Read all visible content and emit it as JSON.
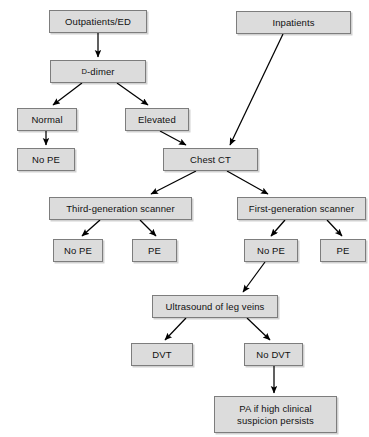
{
  "diagram": {
    "node_fill": "#dcdcdc",
    "node_border": "#7d7d7d",
    "edge_color": "#000000",
    "background": "#ffffff"
  },
  "nodes": {
    "outpatients_ed": "Outpatients/ED",
    "inpatients": "Inpatients",
    "d_dimer_prefix": "D",
    "d_dimer_suffix": "-dimer",
    "normal": "Normal",
    "elevated": "Elevated",
    "no_pe_left": "No PE",
    "chest_ct": "Chest CT",
    "third_generation_scanner": "Third-generation scanner",
    "first_generation_scanner": "First-generation scanner",
    "third_no_pe": "No PE",
    "third_pe": "PE",
    "first_no_pe": "No PE",
    "first_pe": "PE",
    "ultrasound_leg_veins": "Ultrasound of leg veins",
    "dvt": "DVT",
    "no_dvt": "No DVT",
    "pa_high_suspicion": "PA if high clinical\nsuspicion persists"
  },
  "edges": [
    {
      "name": "outpatients-to-d-dimer",
      "from": "outpatients_ed",
      "to": "d_dimer"
    },
    {
      "name": "d-dimer-to-normal",
      "from": "d_dimer",
      "to": "normal"
    },
    {
      "name": "d-dimer-to-elevated",
      "from": "d_dimer",
      "to": "elevated"
    },
    {
      "name": "normal-to-no-pe",
      "from": "normal",
      "to": "no_pe_left"
    },
    {
      "name": "elevated-to-chest-ct",
      "from": "elevated",
      "to": "chest_ct"
    },
    {
      "name": "inpatients-to-chest-ct",
      "from": "inpatients",
      "to": "chest_ct"
    },
    {
      "name": "chest-ct-to-third-generation-scanner",
      "from": "chest_ct",
      "to": "third_generation_scanner"
    },
    {
      "name": "chest-ct-to-first-generation-scanner",
      "from": "chest_ct",
      "to": "first_generation_scanner"
    },
    {
      "name": "third-generation-to-no-pe",
      "from": "third_generation_scanner",
      "to": "third_no_pe"
    },
    {
      "name": "third-generation-to-pe",
      "from": "third_generation_scanner",
      "to": "third_pe"
    },
    {
      "name": "first-generation-to-no-pe",
      "from": "first_generation_scanner",
      "to": "first_no_pe"
    },
    {
      "name": "first-generation-to-pe",
      "from": "first_generation_scanner",
      "to": "first_pe"
    },
    {
      "name": "first-no-pe-to-ultrasound",
      "from": "first_no_pe",
      "to": "ultrasound_leg_veins"
    },
    {
      "name": "ultrasound-to-dvt",
      "from": "ultrasound_leg_veins",
      "to": "dvt"
    },
    {
      "name": "ultrasound-to-no-dvt",
      "from": "ultrasound_leg_veins",
      "to": "no_dvt"
    },
    {
      "name": "no-dvt-to-pa",
      "from": "no_dvt",
      "to": "pa_high_suspicion"
    }
  ]
}
